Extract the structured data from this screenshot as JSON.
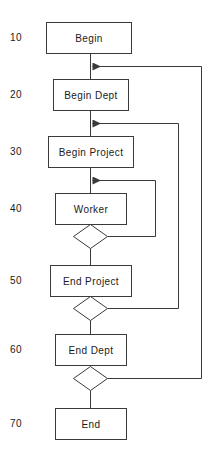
{
  "diagram": {
    "stroke_color": "#3a3a3a",
    "text_color": "#1a1a1a",
    "background_color": "#ffffff"
  },
  "line_numbers": [
    {
      "id": "line-10",
      "label": "10",
      "x": 10,
      "y": 38
    },
    {
      "id": "line-20",
      "label": "20",
      "x": 10,
      "y": 95
    },
    {
      "id": "line-30",
      "label": "30",
      "x": 10,
      "y": 151
    },
    {
      "id": "line-40",
      "label": "40",
      "x": 10,
      "y": 209
    },
    {
      "id": "line-50",
      "label": "50",
      "x": 10,
      "y": 281
    },
    {
      "id": "line-60",
      "label": "60",
      "x": 10,
      "y": 350
    },
    {
      "id": "line-70",
      "label": "70",
      "x": 10,
      "y": 424
    }
  ],
  "nodes": [
    {
      "id": "begin",
      "label": "Begin",
      "shape": "rectangle",
      "x": 46,
      "y": 22,
      "w": 85,
      "h": 31,
      "cx": 88.5,
      "cy": 37.5
    },
    {
      "id": "begin-dept",
      "label": "Begin Dept",
      "shape": "rectangle",
      "x": 53,
      "y": 79,
      "w": 75,
      "h": 31,
      "cx": 90.5,
      "cy": 94.5
    },
    {
      "id": "begin-project",
      "label": "Begin Project",
      "shape": "rectangle",
      "x": 48,
      "y": 136,
      "w": 85,
      "h": 31,
      "cx": 90.5,
      "cy": 151.5
    },
    {
      "id": "worker",
      "label": "Worker",
      "shape": "rectangle",
      "x": 55,
      "y": 193,
      "w": 71,
      "h": 31,
      "cx": 90.5,
      "cy": 208.5
    },
    {
      "id": "end-project",
      "label": "End Project",
      "shape": "rectangle",
      "x": 50,
      "y": 265,
      "w": 81,
      "h": 31,
      "cx": 90.5,
      "cy": 280.5
    },
    {
      "id": "end-dept",
      "label": "End Dept",
      "shape": "rectangle",
      "x": 55,
      "y": 334,
      "w": 71,
      "h": 31,
      "cx": 90.5,
      "cy": 349.5
    },
    {
      "id": "end",
      "label": "End",
      "shape": "rectangle",
      "x": 55,
      "y": 408,
      "w": 71,
      "h": 31,
      "cx": 90.5,
      "cy": 423.5
    }
  ],
  "decisions": [
    {
      "id": "worker-decision",
      "cx": 90.5,
      "cy": 236,
      "rx": 17,
      "ry": 12
    },
    {
      "id": "end-project-decision",
      "cx": 90.5,
      "cy": 308,
      "rx": 17,
      "ry": 12
    },
    {
      "id": "end-dept-decision",
      "cx": 90.5,
      "cy": 378,
      "rx": 17,
      "ry": 12
    }
  ],
  "connectors": [
    {
      "id": "begin-to-begin-dept",
      "type": "vertical",
      "from": "begin",
      "to": "begin-dept"
    },
    {
      "id": "begin-dept-to-begin-project",
      "type": "vertical",
      "from": "begin-dept",
      "to": "begin-project"
    },
    {
      "id": "begin-project-to-worker",
      "type": "vertical",
      "from": "begin-project",
      "to": "worker"
    },
    {
      "id": "worker-to-decision",
      "type": "vertical",
      "from": "worker",
      "to": "worker-decision"
    },
    {
      "id": "decision-to-end-project",
      "type": "vertical",
      "from": "worker-decision",
      "to": "end-project"
    },
    {
      "id": "end-project-to-decision",
      "type": "vertical",
      "from": "end-project",
      "to": "end-project-decision"
    },
    {
      "id": "decision-to-end-dept",
      "type": "vertical",
      "from": "end-project-decision",
      "to": "end-dept"
    },
    {
      "id": "end-dept-to-decision",
      "type": "vertical",
      "from": "end-dept",
      "to": "end-dept-decision"
    },
    {
      "id": "decision-to-end",
      "type": "vertical",
      "from": "end-dept-decision",
      "to": "end"
    }
  ],
  "feedback_loops": [
    {
      "id": "worker-loop",
      "from": "worker-decision",
      "to": "begin-project-input",
      "rail_x": 155,
      "arrow_y": 180,
      "label": ""
    },
    {
      "id": "project-loop",
      "from": "end-project-decision",
      "to": "begin-dept-input",
      "rail_x": 178,
      "arrow_y": 123,
      "label": ""
    },
    {
      "id": "dept-loop",
      "from": "end-dept-decision",
      "to": "begin-input",
      "rail_x": 201,
      "arrow_y": 66,
      "label": ""
    }
  ]
}
